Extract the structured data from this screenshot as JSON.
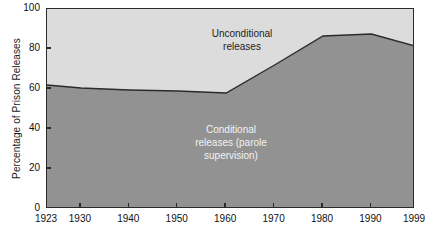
{
  "chart_data": {
    "type": "area",
    "title": "",
    "subtitle": "",
    "xlabel": "",
    "ylabel": "Percentage of Prison Releases",
    "stacked": true,
    "grid": false,
    "legend_position": "in-plot-annotations",
    "xlim": [
      1923,
      1999
    ],
    "ylim": [
      0,
      100
    ],
    "x_ticks": [
      1923,
      1930,
      1940,
      1950,
      1960,
      1970,
      1980,
      1990,
      1999
    ],
    "x_tick_labels": [
      "1923",
      "1930",
      "1940",
      "1950",
      "1960",
      "1970",
      "1980",
      "1990",
      "1999"
    ],
    "y_ticks": [
      0,
      20,
      40,
      60,
      80,
      100
    ],
    "y_tick_labels": [
      "0",
      "20",
      "40",
      "60",
      "80",
      "100"
    ],
    "x": [
      1923,
      1930,
      1940,
      1950,
      1960,
      1970,
      1980,
      1990,
      1999
    ],
    "series": [
      {
        "name": "Conditional releases (parole supervision)",
        "color": "#929292",
        "values": [
          62,
          60.5,
          59.5,
          59,
          58,
          72,
          86.5,
          87.5,
          81.5
        ]
      },
      {
        "name": "Unconditional releases",
        "color": "#dcdcdc",
        "values": [
          38,
          39.5,
          40.5,
          41,
          42,
          28,
          13.5,
          12.5,
          18.5
        ]
      }
    ],
    "annotations": [
      {
        "id": "unconditional-label",
        "text": "Unconditional\nreleases",
        "color": "#1c1c1c",
        "x_center_px": 241,
        "y_top_px": 26
      },
      {
        "id": "conditional-label",
        "text": "Conditional\nreleases (parole\nsupervision)",
        "color": "#f2f2f2",
        "x_center_px": 230,
        "y_top_px": 122
      }
    ],
    "colors": {
      "unconditional_area": "#dcdcdc",
      "conditional_area": "#929292",
      "boundary_line": "#2b2b2b",
      "axis": "#2b2b2b",
      "background": "#ffffff",
      "tick_text": "#111111"
    }
  }
}
